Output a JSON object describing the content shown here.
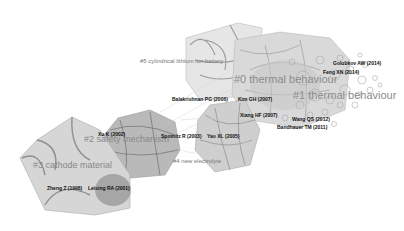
{
  "figure": {
    "type": "co-citation cluster network",
    "clusters": [
      {
        "id": 0,
        "label": "#0 thermal behaviour",
        "x": 234,
        "y": 79,
        "size": "big"
      },
      {
        "id": 1,
        "label": "#1 thermal behaviour",
        "x": 293,
        "y": 95,
        "size": "big"
      },
      {
        "id": 2,
        "label": "#2 safety mechanism",
        "x": 84,
        "y": 139,
        "size": "mid"
      },
      {
        "id": 3,
        "label": "#3 cathode material",
        "x": 33,
        "y": 165,
        "size": "mid"
      },
      {
        "id": 4,
        "label": "#4 new electrolyte",
        "x": 173,
        "y": 160,
        "size": "small"
      },
      {
        "id": 5,
        "label": "#5 cylindrical lithium ion battery",
        "x": 140,
        "y": 61,
        "size": "small"
      }
    ],
    "references": [
      {
        "label": "Golubkov AW (2014)",
        "x": 333,
        "y": 63
      },
      {
        "label": "Feng XN (2014)",
        "x": 323,
        "y": 71
      },
      {
        "label": "Balakrishnan PG (2006)",
        "x": 172,
        "y": 98
      },
      {
        "label": "Kim GH (2007)",
        "x": 238,
        "y": 98
      },
      {
        "label": "Xiang HF (2007)",
        "x": 240,
        "y": 114
      },
      {
        "label": "Wang QS (2012)",
        "x": 292,
        "y": 118
      },
      {
        "label": "Bandhauer TM (2011)",
        "x": 277,
        "y": 126
      },
      {
        "label": "Xu K (2002)",
        "x": 98,
        "y": 133
      },
      {
        "label": "Spotnitz R (2003)",
        "x": 161,
        "y": 135
      },
      {
        "label": "Yao XL (2005)",
        "x": 207,
        "y": 135
      },
      {
        "label": "Zheng Z (1998)",
        "x": 47,
        "y": 187
      },
      {
        "label": "Leising RA (2001)",
        "x": 88,
        "y": 187
      }
    ]
  }
}
